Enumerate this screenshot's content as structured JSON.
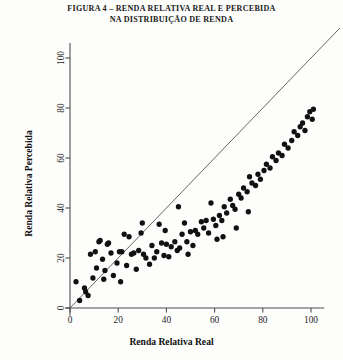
{
  "figure": {
    "title_lines": [
      "FIGURA 4 – RENDA RELATIVA REAL E PERCEBIDA",
      "NA DISTRIBUIÇÃO DE RENDA"
    ]
  },
  "chart_data": {
    "type": "scatter",
    "title": "FIGURA 4 – RENDA RELATIVA REAL E PERCEBIDA NA DISTRIBUIÇÃO DE RENDA",
    "xlabel": "Renda Relativa Real",
    "ylabel": "Renda Relativa Percebida",
    "xlim": [
      -2,
      106
    ],
    "ylim": [
      -3,
      107
    ],
    "xticks": [
      0,
      20,
      40,
      60,
      80,
      100
    ],
    "yticks": [
      0,
      20,
      40,
      60,
      80,
      100
    ],
    "xticklabels": [
      "0",
      "20",
      "40",
      "60",
      "80",
      "100"
    ],
    "yticklabels": [
      "0",
      "20",
      "40",
      "60",
      "80",
      "100"
    ],
    "grid": false,
    "legend": null,
    "marker": {
      "shape": "circle",
      "color": "#111111",
      "size": 4.6
    },
    "reference_line": {
      "name": "identity-line",
      "type": "line",
      "equation": "y = x",
      "color": "#555555",
      "x": [
        0,
        112
      ],
      "y": [
        0,
        112
      ]
    },
    "series": [
      {
        "name": "Renda percebida vs real",
        "points": [
          [
            2.5,
            10.5
          ],
          [
            4.0,
            3.0
          ],
          [
            6.0,
            8.0
          ],
          [
            6.5,
            6.5
          ],
          [
            7.5,
            5.0
          ],
          [
            8.5,
            21.5
          ],
          [
            9.5,
            12.0
          ],
          [
            10.5,
            22.5
          ],
          [
            11.0,
            16.0
          ],
          [
            12.0,
            26.5
          ],
          [
            12.5,
            27.0
          ],
          [
            13.5,
            19.5
          ],
          [
            14.5,
            15.0
          ],
          [
            15.5,
            25.5
          ],
          [
            16.0,
            26.0
          ],
          [
            17.0,
            22.0
          ],
          [
            18.0,
            13.0
          ],
          [
            19.5,
            18.0
          ],
          [
            20.5,
            22.5
          ],
          [
            21.5,
            22.5
          ],
          [
            22.5,
            29.5
          ],
          [
            23.5,
            17.0
          ],
          [
            24.5,
            28.5
          ],
          [
            25.5,
            21.5
          ],
          [
            26.5,
            22.0
          ],
          [
            27.5,
            15.5
          ],
          [
            28.5,
            23.0
          ],
          [
            29.5,
            30.0
          ],
          [
            30.5,
            21.5
          ],
          [
            31.5,
            20.0
          ],
          [
            33.0,
            17.5
          ],
          [
            34.0,
            25.0
          ],
          [
            35.0,
            20.0
          ],
          [
            36.0,
            22.5
          ],
          [
            37.0,
            33.5
          ],
          [
            38.0,
            26.0
          ],
          [
            39.0,
            21.0
          ],
          [
            40.0,
            25.5
          ],
          [
            41.0,
            20.5
          ],
          [
            42.0,
            24.5
          ],
          [
            43.5,
            26.5
          ],
          [
            44.5,
            23.0
          ],
          [
            45.5,
            24.0
          ],
          [
            46.5,
            29.5
          ],
          [
            47.5,
            34.0
          ],
          [
            48.5,
            26.5
          ],
          [
            50.0,
            30.5
          ],
          [
            51.0,
            25.0
          ],
          [
            52.0,
            31.0
          ],
          [
            53.0,
            29.5
          ],
          [
            54.5,
            34.5
          ],
          [
            55.5,
            32.0
          ],
          [
            56.5,
            35.0
          ],
          [
            57.5,
            30.0
          ],
          [
            58.5,
            42.0
          ],
          [
            59.5,
            35.5
          ],
          [
            60.5,
            33.0
          ],
          [
            62.0,
            37.0
          ],
          [
            63.0,
            35.0
          ],
          [
            64.0,
            40.5
          ],
          [
            65.0,
            38.0
          ],
          [
            66.5,
            43.5
          ],
          [
            67.5,
            41.0
          ],
          [
            68.5,
            39.5
          ],
          [
            70.0,
            45.5
          ],
          [
            71.0,
            44.0
          ],
          [
            72.0,
            48.0
          ],
          [
            73.5,
            46.5
          ],
          [
            74.5,
            52.5
          ],
          [
            75.5,
            50.0
          ],
          [
            77.0,
            49.0
          ],
          [
            78.0,
            53.5
          ],
          [
            79.0,
            51.5
          ],
          [
            80.5,
            55.0
          ],
          [
            81.5,
            57.5
          ],
          [
            83.0,
            56.0
          ],
          [
            84.0,
            60.5
          ],
          [
            85.5,
            59.0
          ],
          [
            86.5,
            62.0
          ],
          [
            88.0,
            61.0
          ],
          [
            89.0,
            65.5
          ],
          [
            90.5,
            64.0
          ],
          [
            92.0,
            67.0
          ],
          [
            93.0,
            70.5
          ],
          [
            94.5,
            69.0
          ],
          [
            95.5,
            72.5
          ],
          [
            96.5,
            74.0
          ],
          [
            97.5,
            71.0
          ],
          [
            98.5,
            76.5
          ],
          [
            99.5,
            78.5
          ],
          [
            100.5,
            75.5
          ],
          [
            101.0,
            79.5
          ],
          [
            30.0,
            34.0
          ],
          [
            45.0,
            40.5
          ],
          [
            49.0,
            21.5
          ],
          [
            61.0,
            27.5
          ],
          [
            63.5,
            28.5
          ],
          [
            69.0,
            32.0
          ],
          [
            74.0,
            38.5
          ],
          [
            39.5,
            31.0
          ],
          [
            21.0,
            10.5
          ],
          [
            14.0,
            11.5
          ]
        ]
      }
    ]
  }
}
